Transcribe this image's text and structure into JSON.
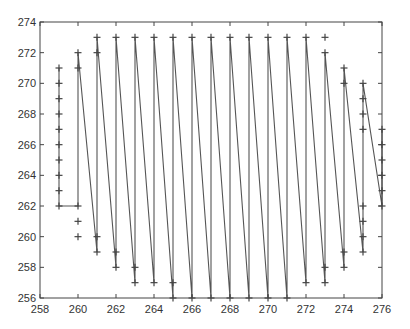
{
  "chart_data": {
    "type": "line",
    "title": "",
    "xlabel": "",
    "ylabel": "",
    "xlim": [
      258,
      276
    ],
    "ylim": [
      256,
      274
    ],
    "xticks": [
      258,
      260,
      262,
      264,
      266,
      268,
      270,
      272,
      274,
      276
    ],
    "yticks": [
      256,
      258,
      260,
      262,
      264,
      266,
      268,
      270,
      272,
      274
    ],
    "grid": false,
    "legend": null,
    "marker": "+",
    "line_color": "#555555",
    "marker_color": "#444444",
    "columns": [
      {
        "x": 259,
        "points": [
          271,
          270,
          269,
          268,
          267,
          266,
          265,
          264,
          263,
          262
        ]
      },
      {
        "x": 260,
        "points": [
          262,
          261,
          260,
          271,
          272
        ]
      },
      {
        "x": 261,
        "points": [
          260,
          259,
          272,
          273
        ]
      },
      {
        "x": 262,
        "points": [
          259,
          258,
          273
        ]
      },
      {
        "x": 263,
        "points": [
          258,
          257,
          273
        ]
      },
      {
        "x": 264,
        "points": [
          257,
          273
        ]
      },
      {
        "x": 265,
        "points": [
          257,
          256,
          273
        ]
      },
      {
        "x": 266,
        "points": [
          256,
          273
        ]
      },
      {
        "x": 267,
        "points": [
          256,
          273
        ]
      },
      {
        "x": 268,
        "points": [
          256,
          273
        ]
      },
      {
        "x": 269,
        "points": [
          256,
          273
        ]
      },
      {
        "x": 270,
        "points": [
          256,
          273
        ]
      },
      {
        "x": 271,
        "points": [
          256,
          273
        ]
      },
      {
        "x": 272,
        "points": [
          257,
          273
        ]
      },
      {
        "x": 273,
        "points": [
          258,
          257,
          272,
          273
        ]
      },
      {
        "x": 274,
        "points": [
          259,
          258,
          270,
          271
        ]
      },
      {
        "x": 275,
        "points": [
          262,
          261,
          260,
          259,
          267,
          268,
          269,
          270
        ]
      },
      {
        "x": 276,
        "points": [
          262,
          263,
          264,
          265,
          266,
          267
        ]
      }
    ],
    "path": [
      [
        259,
        271
      ],
      [
        259,
        262
      ],
      [
        260,
        262
      ],
      [
        260,
        272
      ],
      [
        261,
        259
      ],
      [
        261,
        273
      ],
      [
        262,
        258
      ],
      [
        262,
        273
      ],
      [
        263,
        257
      ],
      [
        263,
        273
      ],
      [
        264,
        257
      ],
      [
        264,
        273
      ],
      [
        265,
        256
      ],
      [
        265,
        273
      ],
      [
        266,
        256
      ],
      [
        266,
        273
      ],
      [
        267,
        256
      ],
      [
        267,
        273
      ],
      [
        268,
        256
      ],
      [
        268,
        273
      ],
      [
        269,
        256
      ],
      [
        269,
        273
      ],
      [
        270,
        256
      ],
      [
        270,
        273
      ],
      [
        271,
        256
      ],
      [
        271,
        273
      ],
      [
        272,
        257
      ],
      [
        272,
        273
      ],
      [
        273,
        257
      ],
      [
        273,
        272
      ],
      [
        274,
        258
      ],
      [
        274,
        271
      ],
      [
        275,
        259
      ],
      [
        275,
        270
      ],
      [
        276,
        262
      ],
      [
        276,
        267
      ]
    ]
  }
}
